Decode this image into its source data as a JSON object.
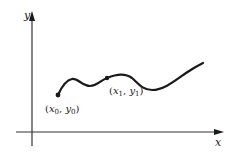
{
  "diagram": {
    "axes": {
      "x_label": "x",
      "y_label": "y"
    },
    "curve": {
      "description": "smooth wavy function curve"
    },
    "points": [
      {
        "name": "x0y0",
        "open": "(",
        "x_var": "x",
        "x_sub": "0",
        "sep": ", ",
        "y_var": "y",
        "y_sub": "0",
        "close": ")"
      },
      {
        "name": "x1y1",
        "open": "(",
        "x_var": "x",
        "x_sub": "1",
        "sep": ", ",
        "y_var": "y",
        "y_sub": "1",
        "close": ")"
      }
    ],
    "colors": {
      "ink": "#1a1a1a",
      "background": "#ffffff"
    }
  }
}
